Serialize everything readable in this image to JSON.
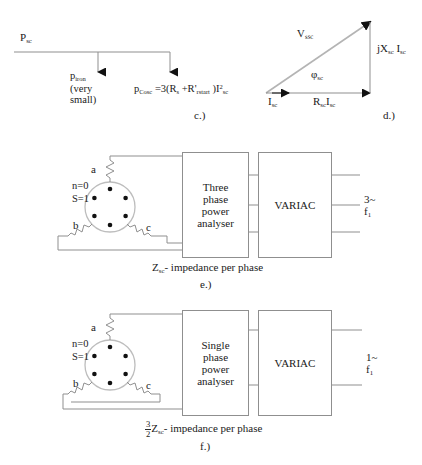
{
  "figure": {
    "panels": [
      "c",
      "d",
      "e",
      "f"
    ]
  },
  "panel_c": {
    "caption": "c.)",
    "input_label_base": "P",
    "input_label_sub": "sc",
    "branch1_line1_base": "p",
    "branch1_line1_sub": "iron",
    "branch1_line2": "(very",
    "branch1_line3": "small)",
    "branch2_base": "p",
    "branch2_sub": "Cosc",
    "branch2_formula": " =3(R",
    "branch2_sub2": "s",
    "branch2_formula2": " +R'",
    "branch2_sub3": "rstart",
    "branch2_formula3": " )I",
    "branch2_sup": "2",
    "branch2_sub4": "sc"
  },
  "panel_d": {
    "caption": "d.)",
    "hypotenuse_base": "V",
    "hypotenuse_sub": "ssc",
    "vertical_base": "jX",
    "vertical_sub": "sc",
    "vertical_base2": " I",
    "vertical_sub2": "sc",
    "horizontal_base": "R",
    "horizontal_sub": "sc",
    "horizontal_base2": "I",
    "horizontal_sub2": "sc",
    "current_base": "I",
    "current_sub": "sc",
    "angle_base": "φ",
    "angle_sub": "sc"
  },
  "panel_e": {
    "caption": "e.)",
    "terminal_a": "a",
    "terminal_b": "b",
    "terminal_c": "c",
    "speed_label": "n=0",
    "slip_label": "S=1",
    "analyser_line1": "Three",
    "analyser_line2": "phase",
    "analyser_line3": "power",
    "analyser_line4": "analyser",
    "variac_label": "VARIAC",
    "supply_line1": "3~",
    "supply_line2_base": "f",
    "supply_line2_sub": "1",
    "impedance_base": "Z",
    "impedance_sub": "sc",
    "impedance_text": "- impedance per phase"
  },
  "panel_f": {
    "caption": "f.)",
    "terminal_a": "a",
    "terminal_b": "b",
    "terminal_c": "c",
    "speed_label": "n=0",
    "slip_label": "S=1",
    "analyser_line1": "Single",
    "analyser_line2": "phase",
    "analyser_line3": "power",
    "analyser_line4": "analyser",
    "variac_label": "VARIAC",
    "supply_line1": "1~",
    "supply_line2_base": "f",
    "supply_line2_sub": "1",
    "frac_num": "3",
    "frac_den": "2",
    "impedance_base": "Z",
    "impedance_sub": "sc",
    "impedance_text": "- impedance per phase"
  },
  "colors": {
    "ink": "#1a1a1a",
    "line": "#8f8f8f",
    "dot": "#111111"
  }
}
